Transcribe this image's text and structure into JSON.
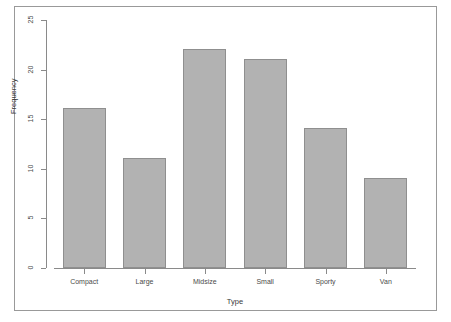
{
  "chart_data": {
    "type": "bar",
    "title": "",
    "subtitle": "",
    "categories": [
      "Compact",
      "Large",
      "Midsize",
      "Small",
      "Sporty",
      "Van"
    ],
    "values": [
      16,
      11,
      22,
      21,
      14,
      9
    ],
    "xlabel": "Type",
    "ylabel": "Frequency",
    "ylim": [
      0,
      25
    ],
    "yticks": [
      0,
      5,
      10,
      15,
      20,
      25
    ],
    "ytick_labels": [
      "0",
      "5",
      "10",
      "15",
      "20",
      "25"
    ],
    "grid": false,
    "legend": false,
    "legend_position": "none",
    "bar_fill_color": "#b2b2b2",
    "bar_border_color": "#8f8f8f",
    "axis_color": "#8a8a8a",
    "frame_color": "#999999",
    "background_color": "#ffffff"
  }
}
